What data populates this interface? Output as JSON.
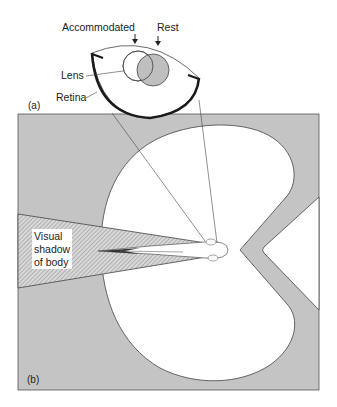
{
  "figure": {
    "panel_a": {
      "label": "(a)",
      "annotations": {
        "accommodated": "Accommodated",
        "rest": "Rest",
        "lens": "Lens",
        "retina": "Retina"
      }
    },
    "panel_b": {
      "label": "(b)",
      "shadow_label_lines": [
        "Visual",
        "shadow",
        "of body"
      ]
    },
    "colors": {
      "background_gray": "#c4c4c4",
      "field_white": "#ffffff",
      "lens_rest_fill": "#b8b8b8",
      "outline": "#444444",
      "retina": "#1a1a1a"
    }
  }
}
